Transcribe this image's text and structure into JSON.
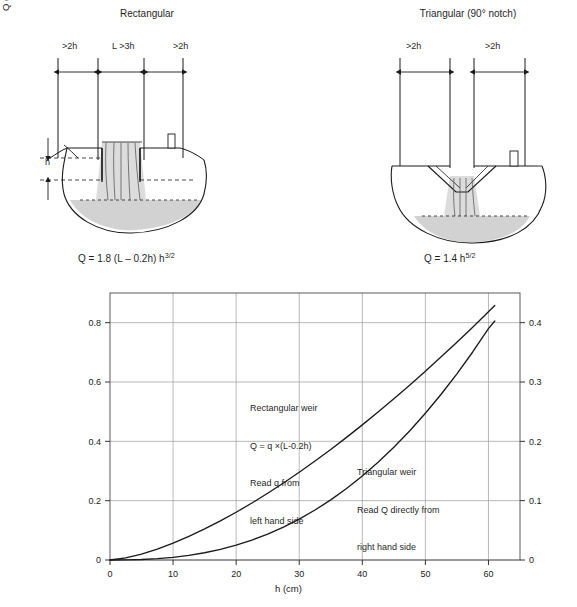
{
  "figure": {
    "panels": [
      {
        "id": "rectangular",
        "title": "Rectangular",
        "formula_main": "Q = 1.8 (L – 0.2h) h",
        "formula_exp": "3/2",
        "dimensions": [
          "&gt;2h",
          "L &gt;3h",
          "&gt;2h"
        ],
        "dim_left": ">2h",
        "dim_mid": "L >3h",
        "dim_right": ">2h",
        "head_label": "h"
      },
      {
        "id": "triangular",
        "title": "Triangular (90° notch)",
        "formula_main": "Q = 1.4 h",
        "formula_exp": "5/2",
        "dim_left": ">2h",
        "dim_right": ">2h"
      }
    ]
  },
  "chart_data": {
    "type": "line",
    "title": "",
    "xlabel": "h (cm)",
    "ylabel_left": "q (m2/s) Rectangular weir only",
    "ylabel_right": "Q (m3/s) Triangular weir only",
    "ylabel_left_parts": {
      "pre": "q (m",
      "sup": "2",
      "post": "/s) Rectangular weir only"
    },
    "ylabel_right_parts": {
      "pre": "Q (m",
      "sup": "3",
      "post": "/s) Triangular weir only"
    },
    "xlim": [
      0,
      65
    ],
    "ylim_left": [
      0,
      0.9
    ],
    "ylim_right": [
      0,
      0.45
    ],
    "xticks": [
      0,
      10,
      20,
      30,
      40,
      50,
      60
    ],
    "xticklabels": [
      "0",
      "10",
      "20",
      "30",
      "40",
      "50",
      "60"
    ],
    "yticks_left": [
      0,
      0.2,
      0.4,
      0.6,
      0.8
    ],
    "yticklabels_left": [
      "0",
      "0.2",
      "0.4",
      "0.6",
      "0.8"
    ],
    "yticks_right": [
      0,
      0.1,
      0.2,
      0.3,
      0.4
    ],
    "yticklabels_right": [
      "0",
      "0.1",
      "0.2",
      "0.3",
      "0.4"
    ],
    "grid": true,
    "legend_position": "inline-annotations",
    "x": [
      0,
      2.5,
      5,
      7.5,
      10,
      12.5,
      15,
      17.5,
      20,
      22.5,
      25,
      27.5,
      30,
      32.5,
      35,
      37.5,
      40,
      42.5,
      45,
      47.5,
      50,
      52.5,
      55,
      57.5,
      60,
      61
    ],
    "series": [
      {
        "name": "Rectangular weir",
        "axis": "left",
        "formula": "q = 1.8 h^(3/2)",
        "values": [
          0,
          0.0071,
          0.0201,
          0.037,
          0.0569,
          0.0796,
          0.1046,
          0.1318,
          0.161,
          0.1922,
          0.225,
          0.2596,
          0.2958,
          0.3335,
          0.3727,
          0.4134,
          0.4554,
          0.4987,
          0.5434,
          0.5893,
          0.6364,
          0.6847,
          0.7342,
          0.7848,
          0.8366,
          0.8576
        ]
      },
      {
        "name": "Triangular weir",
        "axis": "right",
        "formula": "Q = 1.4 h^(5/2)",
        "values": [
          0,
          0.0001,
          0.0008,
          0.0022,
          0.0044,
          0.0077,
          0.0122,
          0.018,
          0.0251,
          0.0336,
          0.0437,
          0.0555,
          0.069,
          0.0843,
          0.1014,
          0.1205,
          0.1416,
          0.1647,
          0.1901,
          0.2175,
          0.2473,
          0.2794,
          0.3138,
          0.3506,
          0.3899,
          0.4029
        ]
      }
    ],
    "annotations": [
      {
        "id": "rectangular-note",
        "lines": [
          "Rectangular weir",
          "Q = q ×(L-0.2h)",
          "Read q from",
          "left hand side"
        ]
      },
      {
        "id": "triangular-note",
        "lines": [
          "Triangular weir",
          "Read Q directly from",
          "right hand side"
        ]
      }
    ]
  },
  "colors": {
    "ink": "#1a1a1a",
    "grid": "#9a9a9a",
    "axis": "#555555",
    "water": "#d8d8d8",
    "bed": "#cfcfcf"
  }
}
